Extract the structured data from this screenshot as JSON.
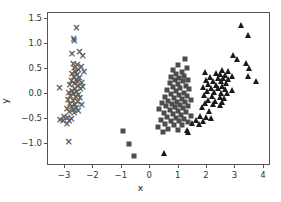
{
  "chart_data": {
    "type": "scatter",
    "title": "",
    "xlabel": "x",
    "ylabel": "y",
    "xlim": [
      -3.6,
      4.25
    ],
    "ylim": [
      -1.45,
      1.62
    ],
    "xticks": [
      -3,
      -2,
      -1,
      0,
      1,
      2,
      3,
      4
    ],
    "xticklabels": [
      "−3",
      "−2",
      "−1",
      "0",
      "1",
      "2",
      "3",
      "4"
    ],
    "yticks": [
      -1.0,
      -0.5,
      0.0,
      0.5,
      1.0,
      1.5
    ],
    "yticklabels": [
      "−1.0",
      "−0.5",
      "0.0",
      "0.5",
      "1.0",
      "1.5"
    ],
    "grid": false,
    "legend": false,
    "series": [
      {
        "name": "cluster-x",
        "marker": "x",
        "color": "#5a5a5a",
        "points": [
          [
            -2.62,
            1.34
          ],
          [
            -2.72,
            1.12
          ],
          [
            -2.7,
            1.07
          ],
          [
            -2.78,
            0.82
          ],
          [
            -2.52,
            0.86
          ],
          [
            -2.4,
            0.78
          ],
          [
            -2.74,
            0.62
          ],
          [
            -2.6,
            0.6
          ],
          [
            -2.46,
            0.56
          ],
          [
            -2.7,
            0.54
          ],
          [
            -2.55,
            0.5
          ],
          [
            -2.36,
            0.45
          ],
          [
            -2.66,
            0.46
          ],
          [
            -2.78,
            0.42
          ],
          [
            -2.6,
            0.4
          ],
          [
            -2.72,
            0.36
          ],
          [
            -2.52,
            0.34
          ],
          [
            -2.64,
            0.3
          ],
          [
            -2.8,
            0.28
          ],
          [
            -2.58,
            0.26
          ],
          [
            -2.44,
            0.24
          ],
          [
            -2.7,
            0.22
          ],
          [
            -2.86,
            0.2
          ],
          [
            -2.56,
            0.18
          ],
          [
            -2.4,
            0.15
          ],
          [
            -3.22,
            0.14
          ],
          [
            -2.68,
            0.12
          ],
          [
            -2.48,
            0.12
          ],
          [
            -2.78,
            0.08
          ],
          [
            -2.62,
            0.06
          ],
          [
            -2.9,
            0.04
          ],
          [
            -2.72,
            0.02
          ],
          [
            -2.55,
            0.0
          ],
          [
            -2.84,
            -0.02
          ],
          [
            -2.66,
            -0.05
          ],
          [
            -2.5,
            -0.07
          ],
          [
            -2.92,
            -0.1
          ],
          [
            -2.74,
            -0.12
          ],
          [
            -2.58,
            -0.14
          ],
          [
            -2.86,
            -0.18
          ],
          [
            -2.68,
            -0.2
          ],
          [
            -2.44,
            -0.2
          ],
          [
            -2.8,
            -0.24
          ],
          [
            -2.62,
            -0.26
          ],
          [
            -2.96,
            -0.28
          ],
          [
            -2.74,
            -0.3
          ],
          [
            -2.56,
            -0.32
          ],
          [
            -2.88,
            -0.34
          ],
          [
            -2.7,
            -0.36
          ],
          [
            -3.06,
            -0.44
          ],
          [
            -2.94,
            -0.46
          ],
          [
            -2.8,
            -0.48
          ],
          [
            -3.2,
            -0.51
          ],
          [
            -3.1,
            -0.52
          ],
          [
            -2.88,
            -0.53
          ],
          [
            -2.96,
            -0.58
          ],
          [
            -2.9,
            -0.94
          ]
        ]
      },
      {
        "name": "cluster-square",
        "marker": "s",
        "color": "#4d4d4d",
        "points": [
          [
            1.22,
            0.69
          ],
          [
            0.96,
            0.57
          ],
          [
            1.28,
            0.51
          ],
          [
            0.8,
            0.48
          ],
          [
            1.1,
            0.44
          ],
          [
            0.92,
            0.4
          ],
          [
            1.2,
            0.36
          ],
          [
            0.74,
            0.33
          ],
          [
            1.02,
            0.31
          ],
          [
            1.32,
            0.28
          ],
          [
            0.86,
            0.27
          ],
          [
            1.14,
            0.25
          ],
          [
            0.68,
            0.22
          ],
          [
            0.98,
            0.19
          ],
          [
            1.26,
            0.16
          ],
          [
            0.8,
            0.14
          ],
          [
            1.06,
            0.11
          ],
          [
            1.38,
            0.09
          ],
          [
            0.6,
            0.07
          ],
          [
            0.9,
            0.05
          ],
          [
            1.18,
            0.02
          ],
          [
            0.72,
            0.0
          ],
          [
            1.0,
            -0.02
          ],
          [
            1.3,
            -0.05
          ],
          [
            0.52,
            -0.07
          ],
          [
            0.84,
            -0.09
          ],
          [
            1.12,
            -0.11
          ],
          [
            1.42,
            -0.12
          ],
          [
            0.64,
            -0.14
          ],
          [
            0.94,
            -0.16
          ],
          [
            1.22,
            -0.17
          ],
          [
            0.42,
            -0.19
          ],
          [
            0.76,
            -0.2
          ],
          [
            1.04,
            -0.22
          ],
          [
            1.34,
            -0.24
          ],
          [
            0.56,
            -0.25
          ],
          [
            0.88,
            -0.27
          ],
          [
            1.16,
            -0.28
          ],
          [
            0.3,
            -0.31
          ],
          [
            0.68,
            -0.33
          ],
          [
            0.98,
            -0.35
          ],
          [
            1.26,
            -0.36
          ],
          [
            0.48,
            -0.38
          ],
          [
            0.8,
            -0.4
          ],
          [
            1.08,
            -0.42
          ],
          [
            1.44,
            -0.44
          ],
          [
            0.6,
            -0.46
          ],
          [
            0.92,
            -0.48
          ],
          [
            1.2,
            -0.5
          ],
          [
            0.38,
            -0.52
          ],
          [
            0.72,
            -0.54
          ],
          [
            1.02,
            -0.55
          ],
          [
            1.32,
            -0.57
          ],
          [
            0.52,
            -0.6
          ],
          [
            0.84,
            -0.62
          ],
          [
            1.12,
            -0.63
          ],
          [
            0.26,
            -0.66
          ],
          [
            0.64,
            -0.7
          ],
          [
            0.96,
            -0.72
          ],
          [
            0.44,
            -0.76
          ],
          [
            -0.95,
            -0.75
          ],
          [
            -0.76,
            -1.0
          ],
          [
            -0.56,
            -1.25
          ]
        ]
      },
      {
        "name": "cluster-triangle",
        "marker": "^",
        "color": "#1a1a1a",
        "points": [
          [
            3.2,
            1.37
          ],
          [
            3.45,
            1.17
          ],
          [
            2.9,
            0.78
          ],
          [
            3.05,
            0.7
          ],
          [
            3.38,
            0.62
          ],
          [
            3.48,
            0.52
          ],
          [
            2.52,
            0.48
          ],
          [
            2.72,
            0.45
          ],
          [
            1.92,
            0.43
          ],
          [
            2.3,
            0.42
          ],
          [
            2.46,
            0.4
          ],
          [
            2.64,
            0.38
          ],
          [
            2.86,
            0.36
          ],
          [
            3.44,
            0.36
          ],
          [
            2.1,
            0.34
          ],
          [
            2.38,
            0.32
          ],
          [
            2.56,
            0.31
          ],
          [
            2.74,
            0.3
          ],
          [
            1.96,
            0.28
          ],
          [
            2.22,
            0.26
          ],
          [
            2.48,
            0.25
          ],
          [
            3.72,
            0.25
          ],
          [
            2.66,
            0.22
          ],
          [
            2.04,
            0.2
          ],
          [
            2.3,
            0.18
          ],
          [
            2.54,
            0.16
          ],
          [
            1.86,
            0.14
          ],
          [
            2.14,
            0.12
          ],
          [
            2.4,
            0.11
          ],
          [
            2.62,
            0.09
          ],
          [
            2.88,
            0.08
          ],
          [
            1.98,
            0.06
          ],
          [
            2.24,
            0.04
          ],
          [
            2.5,
            0.02
          ],
          [
            2.7,
            0.01
          ],
          [
            1.9,
            -0.02
          ],
          [
            2.16,
            -0.05
          ],
          [
            2.44,
            -0.07
          ],
          [
            2.6,
            -0.09
          ],
          [
            2.02,
            -0.12
          ],
          [
            2.28,
            -0.14
          ],
          [
            2.52,
            -0.16
          ],
          [
            1.94,
            -0.19
          ],
          [
            2.2,
            -0.21
          ],
          [
            2.46,
            -0.23
          ],
          [
            1.82,
            -0.26
          ],
          [
            2.08,
            -0.34
          ],
          [
            1.74,
            -0.44
          ],
          [
            1.96,
            -0.46
          ],
          [
            2.14,
            -0.48
          ],
          [
            1.62,
            -0.52
          ],
          [
            1.86,
            -0.55
          ],
          [
            1.46,
            -0.58
          ],
          [
            1.7,
            -0.6
          ],
          [
            1.3,
            -0.72
          ],
          [
            1.34,
            -0.76
          ],
          [
            0.5,
            -1.18
          ]
        ]
      }
    ]
  },
  "axes": {
    "xlabel": "x",
    "ylabel": "y"
  }
}
